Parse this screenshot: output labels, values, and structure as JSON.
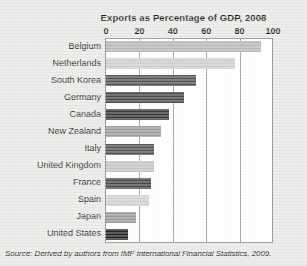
{
  "chart_data": {
    "type": "bar",
    "orientation": "horizontal",
    "title": "Exports as Percentage of GDP, 2008",
    "xlabel": "",
    "ylabel": "",
    "xlim": [
      0,
      100
    ],
    "xticks": [
      0,
      20,
      40,
      60,
      80,
      100
    ],
    "xtick_labels": [
      "0",
      "20",
      "40",
      "60",
      "80",
      "100"
    ],
    "grid": "vertical",
    "legend": "none",
    "categories": [
      "Belgium",
      "Netherlands",
      "South Korea",
      "Germany",
      "Canada",
      "New Zealand",
      "Italy",
      "United Kingdom",
      "France",
      "Spain",
      "Japan",
      "United States"
    ],
    "values": [
      93,
      77,
      54,
      47,
      38,
      33,
      29,
      29,
      27,
      26,
      18,
      13
    ],
    "bar_colors": [
      "#b9b9b9",
      "#cfcfcf",
      "#565656",
      "#4a4a4a",
      "#3b3b3b",
      "#9d9d9d",
      "#565656",
      "#c6c6c6",
      "#4a4a4a",
      "#d2d2d2",
      "#9b9b9b",
      "#252525"
    ]
  },
  "source": {
    "label": "Source:",
    "text_before": "Derived by authors from",
    "italic_title": "IMF International Financial Statistics,",
    "year": "2009."
  },
  "colors": {
    "background": "#e9e9e7",
    "plot_background": "#ffffff",
    "frame": "#8a8a8a",
    "gridline": "#9a9a9a",
    "text": "#231f20"
  }
}
